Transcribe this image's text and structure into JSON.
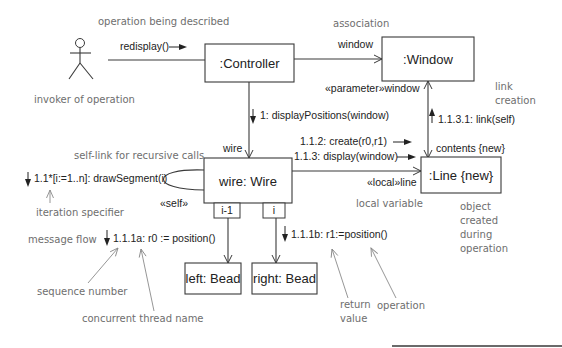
{
  "diagram": {
    "type": "UML collaboration diagram",
    "colors": {
      "ink": "#222222",
      "stroke": "#3a3a3a",
      "annotation": "#6e6e6e",
      "background": "#ffffff"
    },
    "actor": {
      "icon": "stick-figure-icon",
      "label": "invoker of operation"
    },
    "objects": {
      "controller": ":Controller",
      "window": ":Window",
      "wire": "wire: Wire",
      "line": ":Line {new}",
      "left_bead": "left: Bead",
      "right_bead": "right: Bead"
    },
    "qualifiers": {
      "left": "i-1",
      "right": "i"
    },
    "messages": {
      "redisplay": "redisplay()",
      "display_positions": "1: displayPositions(window)",
      "draw_segment": "1.1*[i:=1..n]: drawSegment(i)",
      "position_a": "1.1.1a: r0 := position()",
      "position_b": "1.1.1b: r1:=position()",
      "create": "1.1.2: create(r0,r1)",
      "display": "1.1.3: display(window)",
      "link": "1.1.3.1: link(self)"
    },
    "role_labels": {
      "window_assoc": "window",
      "parameter_window": "«parameter»window",
      "wire_role": "wire",
      "self_stereo": "«self»",
      "local_line": "«local»line",
      "contents_new": "contents {new}"
    },
    "annotations": {
      "operation_described": "operation being described",
      "association": "association",
      "link_creation_1": "link",
      "link_creation_2": "creation",
      "self_link": "self-link for recursive calls",
      "iteration_specifier": "iteration specifier",
      "message_flow": "message flow",
      "sequence_number": "sequence number",
      "concurrent_thread": "concurrent thread name",
      "local_variable": "local variable",
      "object_created_1": "object",
      "object_created_2": "created",
      "object_created_3": "during",
      "object_created_4": "operation",
      "return_value_1": "return",
      "return_value_2": "value",
      "operation": "operation"
    }
  }
}
